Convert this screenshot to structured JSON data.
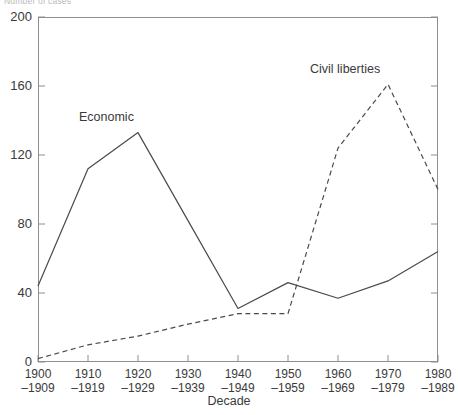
{
  "figure": {
    "y_axis_title_clipped": "Number of cases",
    "x_axis_title": "Decade"
  },
  "labels": {
    "economic": "Economic",
    "civil_liberties": "Civil liberties"
  },
  "axis": {
    "y_ticks": [
      "0",
      "40",
      "80",
      "120",
      "160",
      "200"
    ],
    "x_ticks": [
      {
        "top": "1900",
        "bottom": "–1909"
      },
      {
        "top": "1910",
        "bottom": "–1919"
      },
      {
        "top": "1920",
        "bottom": "–1929"
      },
      {
        "top": "1930",
        "bottom": "–1939"
      },
      {
        "top": "1940",
        "bottom": "–1949"
      },
      {
        "top": "1950",
        "bottom": "–1959"
      },
      {
        "top": "1960",
        "bottom": "–1969"
      },
      {
        "top": "1970",
        "bottom": "–1979"
      },
      {
        "top": "1980",
        "bottom": "–1989"
      }
    ]
  },
  "colors": {
    "axis": "#8e8e8e",
    "economic_line": "#4a4a4a",
    "civil_line": "#4a4a4a",
    "text": "#3a3a3a"
  },
  "chart_data": {
    "type": "line",
    "title": "",
    "xlabel": "Decade",
    "ylabel": "Number of cases",
    "categories": [
      "1900–1909",
      "1910–1919",
      "1920–1929",
      "1930–1939",
      "1940–1949",
      "1950–1959",
      "1960–1969",
      "1970–1979",
      "1980–1989"
    ],
    "series": [
      {
        "name": "Economic",
        "style": "solid",
        "values": [
          44,
          112,
          133,
          82,
          31,
          46,
          37,
          47,
          64
        ]
      },
      {
        "name": "Civil liberties",
        "style": "dashed",
        "values": [
          2,
          10,
          15,
          22,
          28,
          28,
          124,
          161,
          100
        ]
      }
    ],
    "ylim": [
      0,
      200
    ],
    "yticks": [
      0,
      40,
      80,
      120,
      160,
      200
    ],
    "grid": false,
    "legend": "inline-annotations"
  }
}
